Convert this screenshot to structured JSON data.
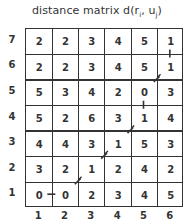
{
  "title": {
    "prefix": "distance matrix d(r",
    "sub_i": "i",
    "mid": ", u",
    "sub_j": "j",
    "suffix": ")"
  },
  "row_labels": [
    "7",
    "6",
    "5",
    "4",
    "3",
    "2",
    "1"
  ],
  "col_labels": [
    "1",
    "2",
    "3",
    "4",
    "5",
    "6"
  ],
  "matrix": [
    [
      "2",
      "2",
      "3",
      "4",
      "5",
      "1"
    ],
    [
      "2",
      "2",
      "3",
      "4",
      "5",
      "1"
    ],
    [
      "5",
      "3",
      "4",
      "2",
      "0",
      "3"
    ],
    [
      "5",
      "2",
      "6",
      "3",
      "1",
      "4"
    ],
    [
      "4",
      "4",
      "3",
      "1",
      "5",
      "3"
    ],
    [
      "3",
      "2",
      "1",
      "2",
      "4",
      "2"
    ],
    [
      "0",
      "0",
      "2",
      "3",
      "4",
      "5"
    ]
  ],
  "warping_path": {
    "description": "optimal alignment path from (1,1) to (6,7)",
    "points": [
      [
        1,
        1
      ],
      [
        2,
        1
      ],
      [
        3,
        2
      ],
      [
        4,
        3
      ],
      [
        5,
        4
      ],
      [
        5,
        5
      ],
      [
        6,
        6
      ],
      [
        6,
        7
      ]
    ],
    "color": "#333333"
  }
}
